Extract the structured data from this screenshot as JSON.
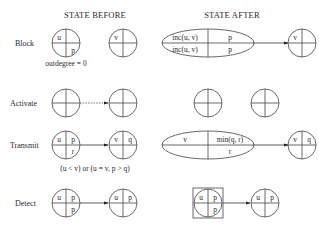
{
  "headers": {
    "before": "STATE BEFORE",
    "after": "STATE AFTER"
  },
  "rows": [
    {
      "label": "Block",
      "before": {
        "node1": {
          "tl": "u",
          "tr": "",
          "br": "p"
        },
        "node2": {
          "tl": "v",
          "tr": ""
        },
        "note": "outdegree = 0"
      },
      "after": {
        "ellipse": {
          "tl": "inc(u, v)",
          "bl": "inc(u, v)",
          "tr": "p",
          "br": "p"
        },
        "node2": {
          "tl": "v"
        }
      }
    },
    {
      "label": "Activate",
      "before": {
        "edge": "dotted"
      },
      "after": {}
    },
    {
      "label": "Transmit",
      "before": {
        "node1": {
          "tl": "u",
          "tr": "p",
          "br": "r"
        },
        "node2": {
          "tl": "v",
          "tr": "q"
        },
        "note": "(u < v) or (u = v,  p > q)"
      },
      "after": {
        "ellipse": {
          "tl": "v",
          "tr": "min(q, r)",
          "br": "r"
        },
        "node2": {
          "tl": "v",
          "tr": "q"
        }
      }
    },
    {
      "label": "Detect",
      "before": {
        "node1": {
          "tl": "u",
          "tr": "p",
          "br": "p"
        },
        "node2": {
          "tl": "u",
          "tr": "p"
        }
      },
      "after": {
        "node1": {
          "tl": "u",
          "tr": "p",
          "br": "p"
        },
        "node2": {
          "tl": "u",
          "tr": "p"
        },
        "boxed": true
      }
    }
  ]
}
